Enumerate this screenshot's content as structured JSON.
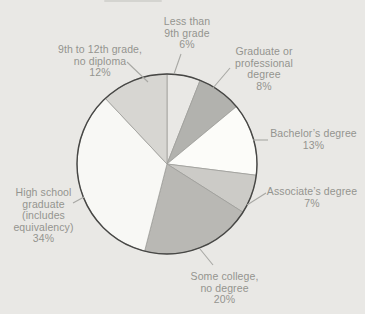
{
  "figure": {
    "background_color": "#e9e8e5",
    "label_text_color": "#94948f",
    "leader_line_color": "#a8a8a4",
    "outline_color": "#474745",
    "divider_color": "#9e9e9a"
  },
  "chart_data": {
    "type": "pie",
    "title": "",
    "direction": "clockwise",
    "start_angle_deg": 0,
    "legend_position": "callout-labels",
    "unit": "percent",
    "slices": [
      {
        "label": "Less than 9th grade",
        "value": 6,
        "display": "Less than\n9th grade\n6%",
        "color": "#e9e8e5"
      },
      {
        "label": "Graduate or professional degree",
        "value": 8,
        "display": "Graduate or\nprofessional\ndegree\n8%",
        "color": "#b2b2ae"
      },
      {
        "label": "Bachelor’s degree",
        "value": 13,
        "display": "Bachelor’s degree\n13%",
        "color": "#fcfcf9"
      },
      {
        "label": "Associate’s degree",
        "value": 7,
        "display": "Associate’s degree\n7%",
        "color": "#cccbc7"
      },
      {
        "label": "Some college, no degree",
        "value": 20,
        "display": "Some college,\nno degree\n20%",
        "color": "#b9b8b4"
      },
      {
        "label": "High school graduate (includes equivalency)",
        "value": 34,
        "display": "High school\ngraduate\n(includes\nequivalency)\n34%",
        "color": "#f8f8f5"
      },
      {
        "label": "9th to 12th grade, no diploma",
        "value": 12,
        "display": "9th to 12th grade,\nno diploma\n12%",
        "color": "#d7d6d2"
      }
    ]
  }
}
